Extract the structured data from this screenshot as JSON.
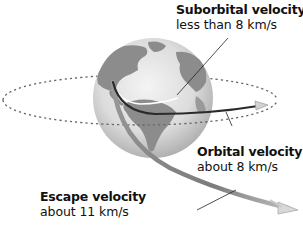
{
  "diagram": {
    "colors": {
      "globe_light": "#e6e6e6",
      "globe_dark": "#a9a9a9",
      "land": "#8c8c8c",
      "orbit_dashed": "#666666",
      "orbital_path": "#2b2b2b",
      "escape_path": "#8a8a8a",
      "leader_line": "#222222"
    },
    "labels": {
      "suborbital": {
        "title": "Suborbital velocity",
        "value": "less than 8 km/s"
      },
      "orbital": {
        "title": "Orbital velocity",
        "value": "about 8 km/s"
      },
      "escape": {
        "title": "Escape velocity",
        "value": "about 11 km/s"
      }
    },
    "icons": {
      "orbital_arrowhead": "arrowhead-icon",
      "escape_arrowhead": "arrowhead-icon",
      "earth": "globe-icon"
    }
  }
}
